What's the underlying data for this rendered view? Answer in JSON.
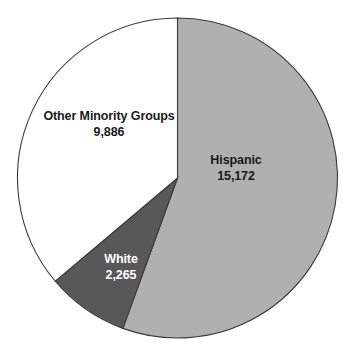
{
  "chart_data": {
    "type": "pie",
    "title": "",
    "subtitle": "",
    "xlabel": "",
    "ylabel": "",
    "legend": "none",
    "grid": false,
    "total": 27323,
    "categories": [
      "Hispanic",
      "White",
      "Other Minority Groups"
    ],
    "values": [
      15172,
      2265,
      9886
    ],
    "value_labels": [
      "15,172",
      "2,265",
      "9,886"
    ],
    "colors": [
      "#b0b0b0",
      "#585858",
      "#ffffff"
    ],
    "label_text_colors": [
      "#1a1a1a",
      "#ffffff",
      "#1a1a1a"
    ],
    "start_angle_deg": 0,
    "direction": "clockwise",
    "slices": [
      {
        "name": "Hispanic",
        "value": 15172,
        "value_label": "15,172",
        "fill": "#b0b0b0",
        "start_deg": 0,
        "end_deg": 199.96,
        "percent": 55.5
      },
      {
        "name": "White",
        "value": 2265,
        "value_label": "2,265",
        "fill": "#585858",
        "start_deg": 199.96,
        "end_deg": 229.81,
        "percent": 8.3
      },
      {
        "name": "Other Minority Groups",
        "value": 9886,
        "value_label": "9,886",
        "fill": "#ffffff",
        "start_deg": 229.81,
        "end_deg": 360,
        "percent": 36.2
      }
    ],
    "geometry": {
      "center_x": 177.5,
      "center_y": 178,
      "radius": 160,
      "outline_color": "#3a3a3a"
    }
  },
  "labels": {
    "other": {
      "name": "Other Minority Groups",
      "value": "9,886"
    },
    "hispanic": {
      "name": "Hispanic",
      "value": "15,172"
    },
    "white": {
      "name": "White",
      "value": "2,265"
    }
  }
}
